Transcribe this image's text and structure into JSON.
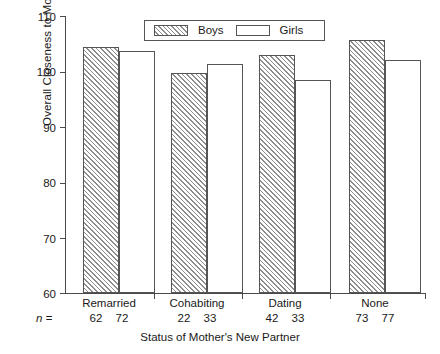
{
  "chart_data": {
    "type": "bar",
    "title": "",
    "xlabel": "Status of Mother's New Partner",
    "ylabel": "Overall Closeness to Mother",
    "categories": [
      "Remarried",
      "Cohabiting",
      "Dating",
      "None"
    ],
    "series": [
      {
        "name": "Boys",
        "values": [
          104.5,
          99.8,
          103.0,
          105.6
        ],
        "pattern": "diagonal-hatch"
      },
      {
        "name": "Girls",
        "values": [
          103.7,
          101.3,
          98.4,
          102.0
        ],
        "pattern": "empty"
      }
    ],
    "group_counts": [
      {
        "category": "Remarried",
        "boys": 62,
        "girls": 72
      },
      {
        "category": "Cohabiting",
        "boys": 22,
        "girls": 33
      },
      {
        "category": "Dating",
        "boys": 42,
        "girls": 33
      },
      {
        "category": "None",
        "boys": 73,
        "girls": 77
      }
    ],
    "n_label": "n =",
    "ylim": [
      60,
      110
    ],
    "yticks": [
      60,
      70,
      80,
      90,
      100,
      110
    ],
    "ytick_labels": [
      "60",
      "70",
      "80",
      "90",
      "100",
      "110"
    ],
    "grid": false,
    "legend_position": "top-center",
    "colors": {
      "line": "#555555",
      "hatch": "#8e8e8e",
      "fill": "#ffffff",
      "axis": "#4a4a4a"
    }
  }
}
